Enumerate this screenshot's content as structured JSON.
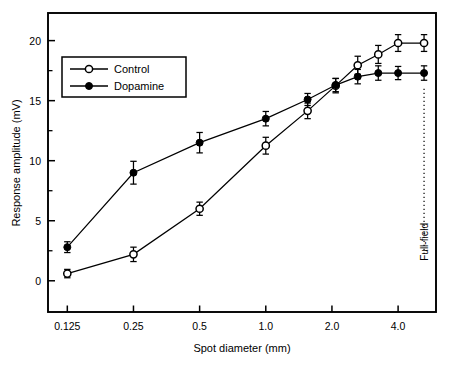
{
  "figure": {
    "background": "#ffffff",
    "frame_color": "#000000"
  },
  "chart_data": {
    "type": "line",
    "title": "",
    "xlabel": "Spot diameter (mm)",
    "ylabel": "Response amplitude (mV)",
    "x_scale": "log2",
    "xlim": [
      0.1021,
      5.95
    ],
    "ylim": [
      -2.6,
      22.3
    ],
    "grid": false,
    "legend_position": "top-left-inside",
    "x_tick_labels": [
      "0.125",
      "0.25",
      "0.5",
      "1.0",
      "2.0",
      "4.0"
    ],
    "x_tick_values": [
      0.125,
      0.25,
      0.5,
      1.0,
      2.0,
      4.0
    ],
    "y_tick_labels": [
      "0",
      "5",
      "10",
      "15",
      "20"
    ],
    "y_tick_values": [
      0,
      5,
      10,
      15,
      20
    ],
    "y_minor_tick_values": [
      2.5,
      7.5,
      12.5,
      17.5
    ],
    "annotations": [
      {
        "text": "Full-field",
        "x": 5.25,
        "orientation": "vertical",
        "line_style": "dotted",
        "from_y": 16.0,
        "to_y": 2.0
      }
    ],
    "series": [
      {
        "name": "Control",
        "marker": "open-circle",
        "marker_fill": "#ffffff",
        "marker_edge": "#000000",
        "line_color": "#000000",
        "x": [
          0.125,
          0.25,
          0.5,
          1.0,
          1.55,
          2.08,
          2.62,
          3.25,
          4.0,
          5.25
        ],
        "values": [
          0.6,
          2.2,
          6.0,
          11.25,
          14.15,
          16.25,
          17.95,
          18.85,
          19.8,
          19.8
        ],
        "errors": [
          0.35,
          0.6,
          0.55,
          0.7,
          0.65,
          0.6,
          0.75,
          0.75,
          0.7,
          0.7
        ]
      },
      {
        "name": "Dopamine",
        "marker": "filled-circle",
        "marker_fill": "#000000",
        "marker_edge": "#000000",
        "line_color": "#000000",
        "x": [
          0.125,
          0.25,
          0.5,
          1.0,
          1.55,
          2.08,
          2.62,
          3.25,
          4.0,
          5.25
        ],
        "values": [
          2.8,
          9.0,
          11.5,
          13.5,
          15.1,
          16.3,
          17.0,
          17.3,
          17.3,
          17.3
        ],
        "errors": [
          0.45,
          0.95,
          0.85,
          0.6,
          0.5,
          0.55,
          0.6,
          0.6,
          0.55,
          0.6
        ]
      }
    ]
  },
  "legend": {
    "entries": [
      {
        "label": "Control",
        "marker": "open-circle"
      },
      {
        "label": "Dopamine",
        "marker": "filled-circle"
      }
    ]
  }
}
